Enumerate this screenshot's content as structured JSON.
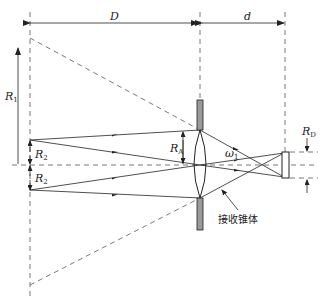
{
  "figure": {
    "labels": {
      "D": "D",
      "d": "d",
      "R1": {
        "main": "R",
        "sub": "1"
      },
      "R2_upper": {
        "main": "R",
        "sub": "2"
      },
      "R2_lower": {
        "main": "R",
        "sub": "2"
      },
      "RA": {
        "main": "R",
        "sub": "A"
      },
      "RD": {
        "main": "R",
        "sub": "D"
      },
      "omega": {
        "main": "ω",
        "sub": "1"
      },
      "cone": "接收锥体"
    },
    "colors": {
      "line": "#222222",
      "dashed": "#555555",
      "aperture_fill": "#9a9a9a"
    }
  }
}
